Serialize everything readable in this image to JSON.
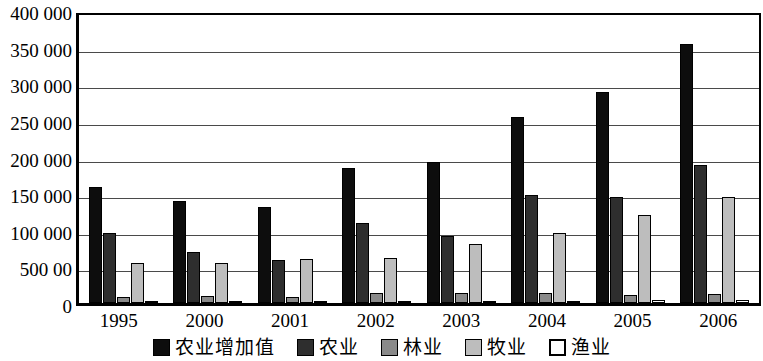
{
  "chart_data": {
    "type": "bar",
    "title": "",
    "subtitle": "",
    "xlabel": "",
    "ylabel": "",
    "categories": [
      "1995",
      "2000",
      "2001",
      "2002",
      "2003",
      "2004",
      "2005",
      "2006"
    ],
    "ylim": [
      0,
      400000
    ],
    "ytick_labels": [
      "400 000",
      "350 000",
      "300 000",
      "250 000",
      "200 000",
      "150 000",
      "100 000",
      "500 00",
      "0"
    ],
    "ytick_values": [
      400000,
      350000,
      300000,
      250000,
      200000,
      150000,
      100000,
      50000,
      0
    ],
    "grid": true,
    "legend_position": "bottom",
    "series": [
      {
        "name": "农业增加值",
        "color": "#0d0d0d",
        "values": [
          158000,
          139000,
          131000,
          185000,
          193000,
          254000,
          288000,
          353000
        ]
      },
      {
        "name": "农业",
        "color": "#2e2e2e",
        "values": [
          95000,
          70000,
          59000,
          109000,
          92000,
          148000,
          145000,
          188000
        ]
      },
      {
        "name": "林业",
        "color": "#8a8a8a",
        "values": [
          8000,
          9000,
          8000,
          14000,
          14000,
          13000,
          11000,
          12000
        ]
      },
      {
        "name": "牧业",
        "color": "#bdbdbd",
        "values": [
          55000,
          55000,
          60000,
          61000,
          81000,
          96000,
          120000,
          145000
        ]
      },
      {
        "name": "渔业",
        "color": "#ffffff",
        "values": [
          2000,
          2000,
          2000,
          2000,
          3000,
          3000,
          4000,
          4000
        ]
      }
    ]
  }
}
